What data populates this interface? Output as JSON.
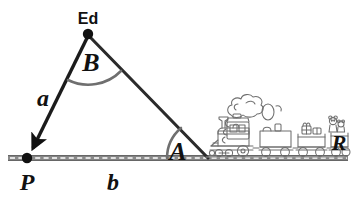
{
  "figure": {
    "type": "geometry-diagram",
    "background_color": "#ffffff",
    "stroke_color": "#222222",
    "arc_color": "#6a6a6a",
    "track_color": "#808080",
    "train_color": "#777777"
  },
  "labels": {
    "vertex_top": "Ed",
    "vertex_left": "P",
    "angle_top": "B",
    "angle_right": "A",
    "side_left": "a",
    "side_bottom": "b",
    "train_car_letter": "R"
  },
  "geometry": {
    "points": {
      "ed": {
        "x": 88,
        "y": 34
      },
      "p": {
        "x": 27,
        "y": 158
      },
      "a_vertex": {
        "x": 207,
        "y": 157
      }
    },
    "baseline": {
      "x1": 8,
      "y1": 158,
      "x2": 348,
      "y2": 158
    },
    "arc_b": {
      "center": "ed",
      "radius": 44,
      "label": "B"
    },
    "arc_a": {
      "center": "a_vertex",
      "radius": 40,
      "label": "A"
    },
    "arrow_on": "side_left",
    "arrow_direction": "toward P"
  }
}
